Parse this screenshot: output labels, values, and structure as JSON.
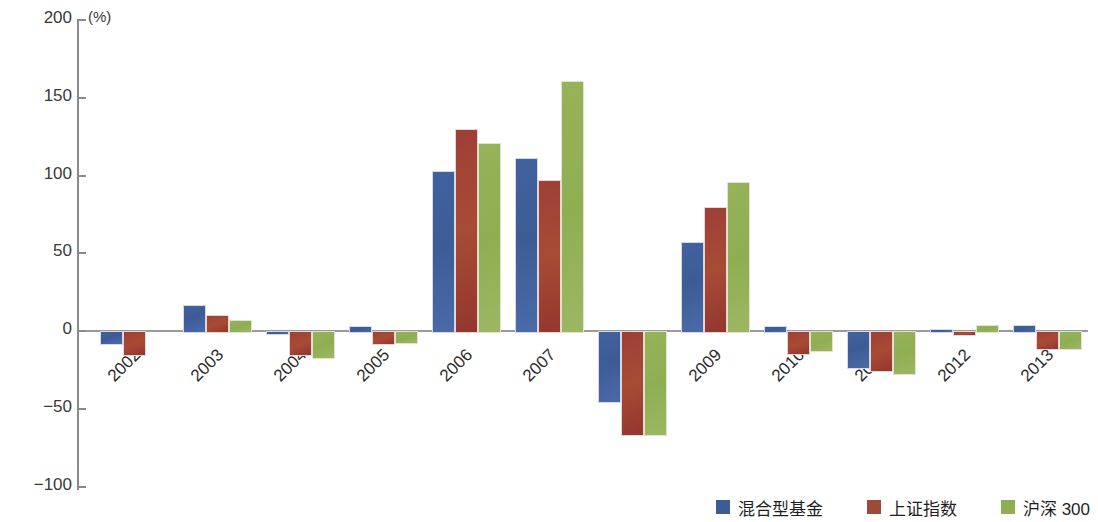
{
  "chart_data": {
    "type": "bar",
    "title": "",
    "subtitle": "",
    "xlabel": "",
    "ylabel": "",
    "unit_label": "(%)",
    "ylim": [
      -100,
      200
    ],
    "yticks": [
      200,
      150,
      100,
      50,
      0,
      -50,
      -100
    ],
    "ytick_labels": [
      "200",
      "150",
      "100",
      "50",
      "0",
      "−50",
      "−100"
    ],
    "grid": false,
    "legend_position": "bottom-right",
    "categories": [
      "2002",
      "2003",
      "2004",
      "2005",
      "2006",
      "2007",
      "2008",
      "2009",
      "2010",
      "2011",
      "2012",
      "2013"
    ],
    "series": [
      {
        "name": "混合型基金",
        "color": "#3d5c96",
        "values": [
          -8,
          17,
          -1,
          3,
          103,
          111,
          -45,
          57,
          3,
          -23,
          1,
          4
        ]
      },
      {
        "name": "上证指数",
        "color": "#9e4a38",
        "values": [
          -15,
          10,
          -15,
          -8,
          130,
          97,
          -66,
          80,
          -14,
          -25,
          -2,
          -11
        ]
      },
      {
        "name": "沪深 300",
        "color": "#8fae52",
        "values": [
          null,
          7,
          -17,
          -7,
          121,
          161,
          -66,
          96,
          -12,
          -27,
          4,
          -11
        ]
      }
    ]
  },
  "legend": {
    "items": [
      {
        "label": "混合型基金",
        "swatch": "blue-swatch-icon"
      },
      {
        "label": "上证指数",
        "swatch": "red-swatch-icon"
      },
      {
        "label": "沪深 300",
        "swatch": "green-swatch-icon"
      }
    ]
  }
}
